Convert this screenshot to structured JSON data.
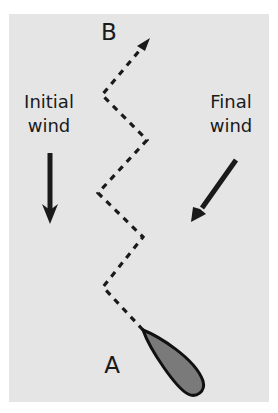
{
  "diagram": {
    "point_start": "A",
    "point_end": "B",
    "initial_wind": {
      "line1": "Initial",
      "line2": "wind"
    },
    "final_wind": {
      "line1": "Final",
      "line2": "wind"
    }
  },
  "colors": {
    "background": "#e5e5e5",
    "stroke": "#1a1a1a",
    "boat_fill": "#7a7a7a"
  }
}
